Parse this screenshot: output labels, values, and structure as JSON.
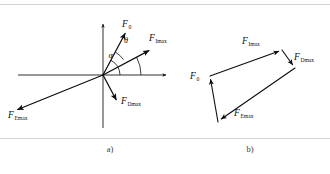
{
  "figure": {
    "background_color": "#ffffff",
    "stroke_color": "#0d0d0d",
    "frame_color": "#c9c9c9",
    "caption_color": "#3a3a3a",
    "width": 330,
    "height": 174
  },
  "panel_a": {
    "caption": "a)",
    "origin": {
      "x": 103,
      "y": 75
    },
    "axes": {
      "x_axis_label": "",
      "y_axis_label": "",
      "x_start": {
        "x": 18,
        "y": 75
      },
      "x_end": {
        "x": 168,
        "y": 75
      },
      "y_start": {
        "x": 103,
        "y": 128
      },
      "y_end": {
        "x": 103,
        "y": 22
      }
    },
    "vectors": [
      {
        "name": "F0",
        "label_base": "F",
        "label_sub": "0",
        "angle_deg": 62,
        "length": 47,
        "label_x": 122,
        "label_y": 27,
        "sub_dx": 6.3,
        "sub_dy": 2.2
      },
      {
        "name": "FImax",
        "label_base": "F",
        "label_sub": "Imax",
        "angle_deg": 28,
        "length": 52,
        "label_x": 149,
        "label_y": 41,
        "sub_dx": 6.3,
        "sub_dy": 2.2
      },
      {
        "name": "FDmax",
        "label_base": "F",
        "label_sub": "Dmax",
        "angle_deg": -62,
        "length": 28,
        "label_x": 121,
        "label_y": 100,
        "sub_dx": 6.3,
        "sub_dy": 2.2
      },
      {
        "name": "FEmax",
        "label_base": "F",
        "label_sub": "Emax",
        "angle_deg": 202,
        "length": 92,
        "label_x": 10,
        "label_y": 112,
        "sub_dx": 6.3,
        "sub_dy": 2.2
      }
    ],
    "angles": [
      {
        "name": "theta",
        "symbol": "θ",
        "label_x": 124,
        "label_y": 41,
        "between": [
          "FImax",
          "F0"
        ],
        "arc_radius": 26
      },
      {
        "name": "alpha",
        "symbol": "α",
        "label_x": 110,
        "label_y": 56,
        "between": [
          "x-axis",
          "F0"
        ],
        "arc_radius": 17
      },
      {
        "name": "alpha_outer_arc",
        "symbol": "",
        "between": [
          "x-axis",
          "FImax"
        ],
        "arc_radius": 38
      }
    ]
  },
  "panel_b": {
    "caption": "b)",
    "description": "tip-to-tail vector polygon",
    "points": {
      "start": {
        "x": 218,
        "y": 122
      },
      "p1": {
        "x": 210,
        "y": 76
      },
      "p2": {
        "x": 282,
        "y": 50
      },
      "p3": {
        "x": 295,
        "y": 68
      }
    },
    "vectors": [
      {
        "name": "F0",
        "label_base": "F",
        "label_sub": "0",
        "from": "start",
        "to": "p1",
        "label_x": 192,
        "label_y": 75,
        "sub_dx": 6.3,
        "sub_dy": 2.2
      },
      {
        "name": "FImax",
        "label_base": "F",
        "label_sub": "Imax",
        "from": "p1",
        "to": "p2",
        "label_x": 244,
        "label_y": 43,
        "sub_dx": 6.3,
        "sub_dy": 2.2
      },
      {
        "name": "FDmax",
        "label_base": "F",
        "label_sub": "Dmax",
        "from": "p2",
        "to": "p3",
        "label_x": 296,
        "label_y": 59,
        "sub_dx": 6.3,
        "sub_dy": 2.2
      },
      {
        "name": "FEmax",
        "label_base": "F",
        "label_sub": "Emax",
        "from": "p3",
        "to": "start",
        "label_x": 236,
        "label_y": 111,
        "sub_dx": 6.3,
        "sub_dy": 2.2
      }
    ]
  },
  "captions": {
    "a_label": "a)",
    "a_x": 110,
    "a_y": 152,
    "b_label": "b)",
    "b_x": 250,
    "b_y": 152
  }
}
